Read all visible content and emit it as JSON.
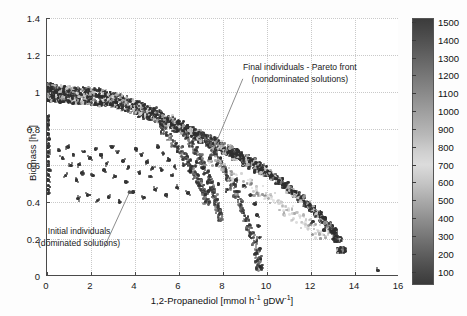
{
  "chart_data": {
    "type": "scatter",
    "title": "",
    "xlabel": "1,2-Propanediol [mmol h⁻¹ gDW⁻¹]",
    "ylabel": "Biomass [h⁻¹]",
    "xlim": [
      0,
      16
    ],
    "ylim": [
      0,
      1.4
    ],
    "xticks": [
      0,
      2,
      4,
      6,
      8,
      10,
      12,
      14,
      16
    ],
    "xticklabels": [
      "0",
      "2",
      "4",
      "6",
      "8",
      "10",
      "12",
      "14",
      "16"
    ],
    "yticks": [
      0,
      0.2,
      0.4,
      0.6,
      0.8,
      1.0,
      1.2,
      1.4
    ],
    "yticklabels": [
      "0",
      "0.2",
      "0.4",
      "0.6",
      "0.8",
      "1",
      "1.2",
      "1.4"
    ],
    "grid": true,
    "legend": "none",
    "colorbar": {
      "min": 100,
      "max": 1500,
      "ticks": [
        100,
        200,
        300,
        400,
        500,
        600,
        700,
        800,
        900,
        1000,
        1100,
        1200,
        1300,
        1400,
        1500
      ],
      "ticklabels": [
        "100",
        "200",
        "300",
        "400",
        "500",
        "600",
        "700",
        "800",
        "900",
        "1000",
        "1100",
        "1200",
        "1300",
        "1400",
        "1500"
      ],
      "colormap": "grayscale-jet",
      "position": "right"
    },
    "annotations": [
      {
        "name": "final-individuals",
        "lines": [
          "Final individuals - Pareto front",
          "(nondominated solutions)"
        ],
        "text_xy": [
          8.9,
          1.07
        ],
        "arrow_to": [
          7.45,
          0.655
        ]
      },
      {
        "name": "initial-individuals",
        "lines": [
          "Initial individuals",
          "(dominated solutions)"
        ],
        "text_xy": [
          2.6,
          0.155
        ],
        "arrow_to": [
          3.75,
          0.455
        ]
      }
    ],
    "series": [
      {
        "name": "Pareto front band",
        "marker": "*",
        "color_by": "generation",
        "points": [
          [
            0.02,
            1.015
          ],
          [
            0.05,
            1.012
          ],
          [
            0.1,
            1.01
          ],
          [
            0.18,
            1.008
          ],
          [
            0.28,
            1.006
          ],
          [
            0.4,
            1.004
          ],
          [
            0.55,
            1.002
          ],
          [
            0.72,
            1.0
          ],
          [
            0.9,
            0.998
          ],
          [
            1.1,
            0.996
          ],
          [
            1.32,
            0.994
          ],
          [
            1.55,
            0.992
          ],
          [
            1.8,
            0.99
          ],
          [
            2.05,
            0.987
          ],
          [
            2.3,
            0.984
          ],
          [
            2.55,
            0.98
          ],
          [
            2.8,
            0.974
          ],
          [
            3.05,
            0.966
          ],
          [
            3.3,
            0.957
          ],
          [
            3.55,
            0.947
          ],
          [
            3.8,
            0.936
          ],
          [
            4.05,
            0.924
          ],
          [
            4.3,
            0.912
          ],
          [
            4.55,
            0.899
          ],
          [
            4.8,
            0.886
          ],
          [
            5.05,
            0.873
          ],
          [
            5.3,
            0.859
          ],
          [
            5.55,
            0.845
          ],
          [
            5.8,
            0.831
          ],
          [
            6.05,
            0.817
          ],
          [
            6.3,
            0.803
          ],
          [
            6.55,
            0.789
          ],
          [
            6.8,
            0.775
          ],
          [
            7.05,
            0.76
          ],
          [
            7.3,
            0.746
          ],
          [
            7.55,
            0.731
          ],
          [
            7.8,
            0.716
          ],
          [
            8.05,
            0.701
          ],
          [
            8.3,
            0.686
          ],
          [
            8.55,
            0.67
          ],
          [
            8.8,
            0.654
          ],
          [
            9.05,
            0.637
          ],
          [
            9.3,
            0.62
          ],
          [
            9.55,
            0.602
          ],
          [
            9.8,
            0.583
          ],
          [
            10.05,
            0.563
          ],
          [
            10.3,
            0.543
          ],
          [
            10.55,
            0.521
          ],
          [
            10.8,
            0.498
          ],
          [
            11.05,
            0.474
          ],
          [
            11.3,
            0.45
          ],
          [
            11.55,
            0.424
          ],
          [
            11.8,
            0.397
          ],
          [
            12.05,
            0.369
          ],
          [
            12.3,
            0.34
          ],
          [
            12.55,
            0.31
          ],
          [
            12.8,
            0.278
          ],
          [
            13.0,
            0.248
          ],
          [
            13.2,
            0.205
          ],
          [
            13.38,
            0.145
          ]
        ]
      },
      {
        "name": "Branch A",
        "points": [
          [
            6.3,
            0.76
          ],
          [
            6.55,
            0.72
          ],
          [
            6.75,
            0.68
          ],
          [
            6.95,
            0.64
          ],
          [
            7.1,
            0.6
          ],
          [
            7.25,
            0.56
          ],
          [
            7.4,
            0.52
          ],
          [
            7.52,
            0.48
          ],
          [
            7.62,
            0.44
          ],
          [
            7.7,
            0.4
          ],
          [
            7.78,
            0.36
          ],
          [
            7.85,
            0.32
          ]
        ]
      },
      {
        "name": "Branch B",
        "points": [
          [
            7.1,
            0.76
          ],
          [
            7.35,
            0.715
          ],
          [
            7.6,
            0.67
          ],
          [
            7.85,
            0.625
          ],
          [
            8.05,
            0.58
          ],
          [
            8.25,
            0.535
          ],
          [
            8.45,
            0.49
          ],
          [
            8.62,
            0.445
          ],
          [
            8.78,
            0.4
          ],
          [
            8.92,
            0.355
          ],
          [
            9.05,
            0.31
          ],
          [
            9.18,
            0.265
          ],
          [
            9.3,
            0.22
          ],
          [
            9.42,
            0.175
          ],
          [
            9.52,
            0.13
          ],
          [
            9.6,
            0.085
          ],
          [
            9.66,
            0.045
          ]
        ]
      },
      {
        "name": "Branch C",
        "points": [
          [
            5.3,
            0.79
          ],
          [
            5.55,
            0.755
          ],
          [
            5.8,
            0.72
          ],
          [
            6.05,
            0.685
          ],
          [
            6.25,
            0.65
          ],
          [
            6.45,
            0.615
          ],
          [
            6.62,
            0.58
          ],
          [
            6.78,
            0.545
          ],
          [
            6.92,
            0.51
          ],
          [
            7.05,
            0.475
          ],
          [
            7.16,
            0.44
          ],
          [
            7.26,
            0.405
          ]
        ]
      },
      {
        "name": "Light fan (late generations)",
        "points": [
          [
            7.6,
            0.64
          ],
          [
            8.1,
            0.6
          ],
          [
            8.6,
            0.56
          ],
          [
            9.1,
            0.52
          ],
          [
            9.6,
            0.48
          ],
          [
            10.1,
            0.44
          ],
          [
            10.55,
            0.405
          ],
          [
            11.0,
            0.37
          ],
          [
            11.4,
            0.335
          ],
          [
            11.8,
            0.3
          ],
          [
            12.15,
            0.268
          ],
          [
            12.5,
            0.238
          ]
        ]
      },
      {
        "name": "Initial individuals (dominated)",
        "marker": "*",
        "color": "#2b2b2b",
        "points": [
          [
            0.05,
            0.865
          ],
          [
            0.06,
            0.845
          ],
          [
            0.05,
            0.82
          ],
          [
            0.07,
            0.795
          ],
          [
            0.05,
            0.77
          ],
          [
            0.08,
            0.745
          ],
          [
            0.06,
            0.72
          ],
          [
            0.05,
            0.7
          ],
          [
            0.07,
            0.672
          ],
          [
            0.05,
            0.648
          ],
          [
            0.06,
            0.622
          ],
          [
            0.05,
            0.6
          ],
          [
            0.08,
            0.575
          ],
          [
            0.06,
            0.548
          ],
          [
            0.05,
            0.52
          ],
          [
            0.07,
            0.492
          ],
          [
            0.05,
            0.47
          ],
          [
            0.06,
            0.45
          ],
          [
            0.55,
            0.68
          ],
          [
            0.7,
            0.64
          ],
          [
            0.95,
            0.7
          ],
          [
            1.2,
            0.66
          ],
          [
            1.45,
            0.605
          ],
          [
            1.1,
            0.6
          ],
          [
            1.7,
            0.675
          ],
          [
            1.95,
            0.64
          ],
          [
            2.2,
            0.69
          ],
          [
            2.45,
            0.655
          ],
          [
            2.7,
            0.61
          ],
          [
            2.95,
            0.7
          ],
          [
            3.2,
            0.67
          ],
          [
            3.45,
            0.625
          ],
          [
            3.7,
            0.59
          ],
          [
            1.6,
            0.56
          ],
          [
            2.1,
            0.545
          ],
          [
            2.6,
            0.575
          ],
          [
            3.1,
            0.54
          ],
          [
            3.6,
            0.51
          ],
          [
            0.85,
            0.545
          ],
          [
            1.35,
            0.52
          ],
          [
            4.05,
            0.69
          ],
          [
            4.3,
            0.655
          ],
          [
            4.55,
            0.62
          ],
          [
            4.8,
            0.585
          ],
          [
            5.05,
            0.7
          ],
          [
            5.3,
            0.665
          ],
          [
            5.55,
            0.63
          ],
          [
            5.8,
            0.595
          ],
          [
            4.2,
            0.56
          ],
          [
            4.7,
            0.54
          ],
          [
            5.2,
            0.575
          ],
          [
            5.7,
            0.545
          ],
          [
            6.2,
            0.6
          ],
          [
            6.5,
            0.57
          ],
          [
            6.8,
            0.62
          ],
          [
            7.1,
            0.585
          ],
          [
            7.4,
            0.64
          ],
          [
            7.7,
            0.605
          ],
          [
            3.9,
            0.455
          ],
          [
            4.4,
            0.425
          ],
          [
            4.9,
            0.47
          ],
          [
            5.4,
            0.44
          ],
          [
            5.9,
            0.48
          ],
          [
            6.4,
            0.45
          ],
          [
            6.9,
            0.49
          ],
          [
            7.35,
            0.46
          ],
          [
            7.8,
            0.5
          ],
          [
            8.2,
            0.47
          ],
          [
            2.8,
            0.43
          ],
          [
            3.3,
            0.4
          ],
          [
            2.3,
            0.41
          ],
          [
            1.85,
            0.44
          ],
          [
            1.4,
            0.42
          ],
          [
            8.6,
            0.52
          ],
          [
            8.95,
            0.49
          ],
          [
            9.25,
            0.44
          ],
          [
            9.45,
            0.39
          ],
          [
            9.55,
            0.33
          ],
          [
            9.62,
            0.27
          ],
          [
            9.65,
            0.21
          ],
          [
            9.68,
            0.15
          ],
          [
            9.7,
            0.095
          ],
          [
            9.72,
            0.05
          ],
          [
            15.05,
            0.03
          ],
          [
            13.05,
            0.2
          ],
          [
            12.6,
            0.25
          ],
          [
            12.1,
            0.295
          ]
        ]
      }
    ]
  },
  "axes": {
    "xlabel_main": "1,2-Propanediol [mmol h",
    "xlabel_sup1": "-1",
    "xlabel_mid": " gDW",
    "xlabel_sup2": "-1",
    "xlabel_end": "]",
    "ylabel_main": "Biomass [h",
    "ylabel_sup": "-1",
    "ylabel_end": "]"
  }
}
